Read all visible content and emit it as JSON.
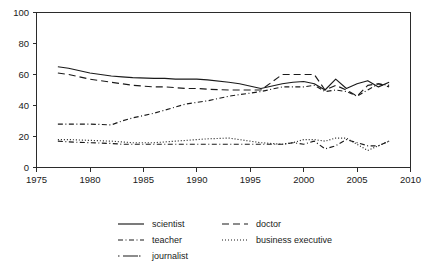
{
  "chart_data": {
    "type": "line",
    "title": "",
    "subtitle": "",
    "xlabel": "",
    "ylabel": "",
    "xlim": [
      1975,
      2010
    ],
    "ylim": [
      0,
      100
    ],
    "xticks": [
      1975,
      1980,
      1985,
      1990,
      1995,
      2000,
      2005,
      2010
    ],
    "yticks": [
      0,
      20,
      40,
      60,
      80,
      100
    ],
    "grid": false,
    "legend_position": "bottom",
    "x": [
      1977,
      1978,
      1980,
      1982,
      1983,
      1984,
      1986,
      1987,
      1988,
      1989,
      1990,
      1991,
      1993,
      1994,
      1996,
      1998,
      1999,
      2000,
      2001,
      2002,
      2003,
      2004,
      2005,
      2006,
      2007,
      2008
    ],
    "series": [
      {
        "name": "scientist",
        "linestyle": "solid",
        "values": [
          65,
          64,
          61,
          59,
          58.5,
          58,
          57.5,
          57.5,
          57,
          57,
          57,
          56.5,
          55,
          54,
          51,
          54,
          55,
          55.5,
          54,
          50,
          57,
          51,
          54,
          56,
          52,
          55
        ]
      },
      {
        "name": "doctor",
        "linestyle": "dashed",
        "values": [
          61,
          60,
          57,
          55,
          54,
          53,
          52,
          52,
          51.5,
          51,
          51,
          50.5,
          50,
          50,
          50,
          60,
          60,
          60,
          60,
          50,
          53,
          50,
          46,
          53,
          54,
          52
        ]
      },
      {
        "name": "teacher",
        "linestyle": "dashdot",
        "values": [
          28,
          28,
          28,
          27.5,
          30,
          32,
          35,
          37,
          39,
          41,
          42,
          43,
          46,
          47,
          49,
          52,
          52,
          52,
          53,
          49,
          50,
          49,
          46,
          50,
          54,
          53
        ]
      },
      {
        "name": "business executive",
        "linestyle": "dotted",
        "values": [
          18,
          18,
          17.5,
          17,
          16.5,
          16,
          16,
          16.5,
          17,
          17.5,
          18,
          18.5,
          19,
          18,
          16,
          15,
          16,
          18,
          18,
          17,
          19,
          19,
          15,
          11,
          14,
          17
        ]
      },
      {
        "name": "journalist",
        "linestyle": "dashdot",
        "values": [
          17,
          16.5,
          16,
          15.5,
          15,
          15,
          15,
          15,
          15,
          15,
          15,
          15,
          15,
          15,
          15,
          15,
          16,
          15,
          17,
          12,
          14,
          18,
          16,
          14,
          14,
          17
        ]
      }
    ],
    "legend_entries": [
      {
        "label": "scientist",
        "linestyle": "solid"
      },
      {
        "label": "doctor",
        "linestyle": "dashed"
      },
      {
        "label": "teacher",
        "linestyle": "dashdot"
      },
      {
        "label": "business executive",
        "linestyle": "dotted"
      },
      {
        "label": "journalist",
        "linestyle": "dashdot-long"
      }
    ]
  },
  "axes": {
    "x_tick_labels": [
      "1975",
      "1980",
      "1985",
      "1990",
      "1995",
      "2000",
      "2005",
      "2010"
    ],
    "y_tick_labels": [
      "0",
      "20",
      "40",
      "60",
      "80",
      "100"
    ]
  },
  "colors": {
    "ink": "#1a1a1a",
    "axis": "#2b2b2b",
    "background": "#ffffff"
  }
}
